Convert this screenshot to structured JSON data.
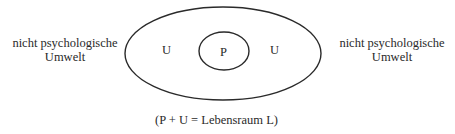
{
  "diagram": {
    "type": "nested-ellipses",
    "outer_region": {
      "label_left": "U",
      "label_right": "U",
      "stroke": "#2a2a2a"
    },
    "inner_region": {
      "label": "P",
      "stroke": "#2a2a2a"
    },
    "outside_left": {
      "line1": "nicht psychologische",
      "line2": "Umwelt"
    },
    "outside_right": {
      "line1": "nicht psychologische",
      "line2": "Umwelt"
    },
    "caption": "(P + U = Lebensraum L)"
  }
}
